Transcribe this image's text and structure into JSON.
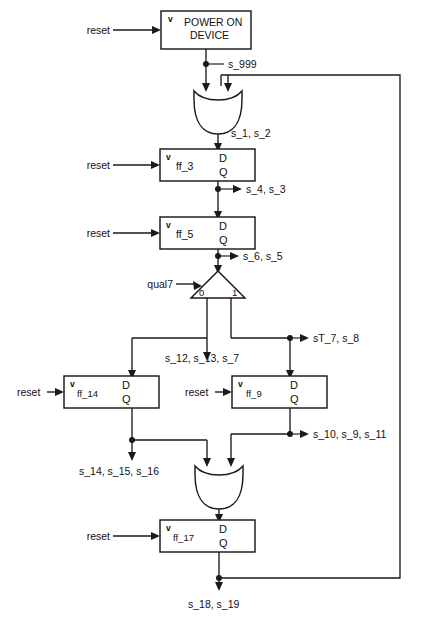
{
  "diagram": {
    "ink_color": "#1a1a1a",
    "background_color": "#ffffff",
    "reset_label": "reset",
    "clock_glyph": "v",
    "d_label": "D",
    "q_label": "Q",
    "blocks": [
      {
        "id": "power-on-device",
        "kind": "block",
        "label_line1": "POWER ON",
        "label_line2": "DEVICE",
        "has_reset": true,
        "has_clock_glyph": true
      },
      {
        "id": "ff_3",
        "kind": "flipflop",
        "label": "ff_3",
        "has_reset": true,
        "has_clock_glyph": true
      },
      {
        "id": "ff_5",
        "kind": "flipflop",
        "label": "ff_5",
        "has_reset": true,
        "has_clock_glyph": true
      },
      {
        "id": "ff_14",
        "kind": "flipflop",
        "label": "ff_14",
        "has_reset": true,
        "has_clock_glyph": true
      },
      {
        "id": "ff_9",
        "kind": "flipflop",
        "label": "ff_9",
        "has_reset": true,
        "has_clock_glyph": true
      },
      {
        "id": "ff_17",
        "kind": "flipflop",
        "label": "ff_17",
        "has_reset": true,
        "has_clock_glyph": true
      }
    ],
    "gates": [
      {
        "id": "or-gate-top",
        "kind": "or",
        "inputs": 2
      },
      {
        "id": "or-gate-bottom",
        "kind": "or",
        "inputs": 2
      }
    ],
    "mux": {
      "id": "mux-qual7",
      "select_label": "qual7",
      "port_left_label": "0",
      "port_right_label": "1"
    },
    "signal_labels": [
      {
        "id": "s_999",
        "text": "s_999"
      },
      {
        "id": "s_1_s_2",
        "text": "s_1, s_2"
      },
      {
        "id": "s_4_s_3",
        "text": "s_4, s_3"
      },
      {
        "id": "s_6_s_5",
        "text": "s_6, s_5"
      },
      {
        "id": "sT_7_s_8",
        "text": "sT_7, s_8"
      },
      {
        "id": "s_12_s_13_s_7",
        "text": "s_12, s_13, s_7"
      },
      {
        "id": "s_14_s_15_s_16",
        "text": "s_14, s_15, s_16"
      },
      {
        "id": "s_10_s_9_s_11",
        "text": "s_10, s_9,  s_11"
      },
      {
        "id": "s_18_s_19",
        "text": "s_18, s_19"
      }
    ]
  }
}
